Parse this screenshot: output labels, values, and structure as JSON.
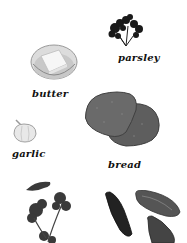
{
  "illustration": {
    "items": [
      {
        "name": "parsley",
        "label": "parsley"
      },
      {
        "name": "butter",
        "label": "butter"
      },
      {
        "name": "garlic",
        "label": "garlic"
      },
      {
        "name": "bread",
        "label": "bread"
      },
      {
        "name": "cilantro",
        "label": ""
      },
      {
        "name": "mussels",
        "label": ""
      }
    ]
  }
}
